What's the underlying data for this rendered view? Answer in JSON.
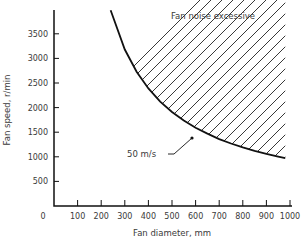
{
  "chart_data": {
    "type": "area",
    "title": "",
    "xlabel": "Fan diameter, mm",
    "ylabel": "Fan speed, r/min",
    "xlim": [
      0,
      1000
    ],
    "ylim": [
      0,
      4000
    ],
    "x_ticks": [
      0,
      100,
      200,
      300,
      400,
      500,
      600,
      700,
      800,
      900,
      1000
    ],
    "y_ticks": [
      500,
      1000,
      1500,
      2000,
      2500,
      3000,
      3500
    ],
    "grid": false,
    "series": [
      {
        "name": "50 m/s",
        "x": [
          240,
          300,
          350,
          400,
          450,
          500,
          550,
          600,
          650,
          700,
          750,
          800,
          850,
          900,
          950,
          980
        ],
        "y": [
          3980,
          3180,
          2730,
          2390,
          2120,
          1910,
          1740,
          1590,
          1470,
          1360,
          1270,
          1190,
          1120,
          1060,
          1005,
          975
        ]
      }
    ],
    "shaded_region": {
      "label": "Fan noise excessive",
      "description": "Hatched area above the 50 m/s tip-speed curve"
    },
    "annotations": [
      {
        "text": "Fan noise excessive",
        "x": 470,
        "y": 3850
      },
      {
        "text": "50 m/s",
        "x": 420,
        "y": 1050,
        "arrow_to": [
          590,
          1420
        ]
      }
    ]
  },
  "labels": {
    "x_axis": "Fan diameter, mm",
    "y_axis": "Fan speed, r/min",
    "region": "Fan noise excessive",
    "curve": "50 m/s"
  }
}
